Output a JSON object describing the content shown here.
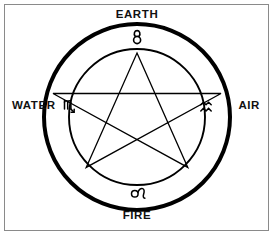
{
  "diagram": {
    "type": "esoteric-pentagram-wheel",
    "stroke_color": "#000000",
    "background_color": "#ffffff",
    "frame_color": "#8a8a8a",
    "center": {
      "x": 137,
      "y": 117
    },
    "outer_circle": {
      "radius": 93,
      "stroke_width": 4
    },
    "inner_circle": {
      "radius": 68,
      "stroke_width": 1.8
    },
    "pentagram": {
      "radius": 64,
      "stroke_width": 1.2
    }
  },
  "elements": [
    {
      "key": "earth",
      "label": "EARTH",
      "position": "top"
    },
    {
      "key": "air",
      "label": "AIR",
      "position": "right"
    },
    {
      "key": "fire",
      "label": "FIRE",
      "position": "bottom"
    },
    {
      "key": "water",
      "label": "WATER",
      "position": "left"
    }
  ],
  "zodiac_glyphs": [
    {
      "key": "taurus",
      "name": "taurus-glyph",
      "symbol": "♉",
      "position": "top",
      "element": "EARTH"
    },
    {
      "key": "aquarius",
      "name": "aquarius-glyph",
      "symbol": "♒",
      "position": "right",
      "element": "AIR"
    },
    {
      "key": "leo",
      "name": "leo-glyph",
      "symbol": "♌",
      "position": "bottom",
      "element": "FIRE"
    },
    {
      "key": "scorpio",
      "name": "scorpio-glyph",
      "symbol": "♏",
      "position": "left",
      "element": "WATER"
    }
  ]
}
